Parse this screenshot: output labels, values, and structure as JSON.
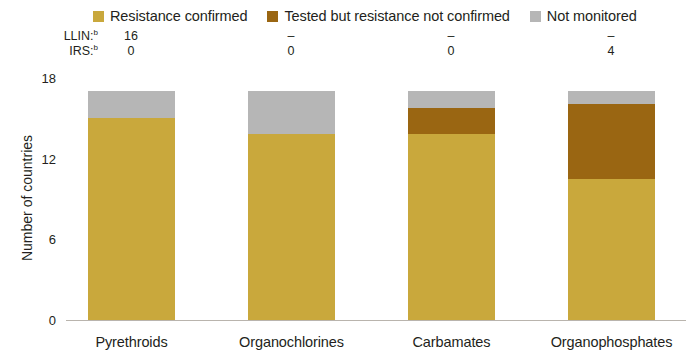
{
  "legend": {
    "items": [
      {
        "label": "Resistance confirmed",
        "color": "#c9a83c",
        "icon": "legend-swatch-resistance-confirmed"
      },
      {
        "label": "Tested but resistance not confirmed",
        "color": "#9a6612",
        "icon": "legend-swatch-tested-not-confirmed"
      },
      {
        "label": "Not monitored",
        "color": "#b6b6b6",
        "icon": "legend-swatch-not-monitored"
      }
    ]
  },
  "annotations": {
    "rows": [
      {
        "key": "LLIN:",
        "sup": "b",
        "values": [
          "16",
          "–",
          "–",
          "–"
        ]
      },
      {
        "key": "IRS:",
        "sup": "b",
        "values": [
          "0",
          "0",
          "0",
          "4"
        ]
      }
    ]
  },
  "chart_data": {
    "type": "bar",
    "stacked": true,
    "title": "",
    "xlabel": "",
    "ylabel": "Number of countries",
    "categories": [
      "Pyrethroids",
      "Organochlorines",
      "Carbamates",
      "Organophosphates"
    ],
    "ylim": [
      0,
      18
    ],
    "yticks": [
      0,
      6,
      12,
      18
    ],
    "ytick_labels": [
      "0",
      "6",
      "12",
      "18"
    ],
    "grid": false,
    "legend_position": "top",
    "series": [
      {
        "name": "Resistance confirmed",
        "color": "#c9a83c",
        "values": [
          15.0,
          13.8,
          13.8,
          10.5
        ]
      },
      {
        "name": "Tested but resistance not confirmed",
        "color": "#9a6612",
        "values": [
          0.0,
          0.0,
          2.0,
          5.6
        ]
      },
      {
        "name": "Not monitored",
        "color": "#b6b6b6",
        "values": [
          2.0,
          3.2,
          1.2,
          0.9
        ]
      }
    ],
    "totals": [
      17,
      17,
      17,
      17
    ]
  }
}
